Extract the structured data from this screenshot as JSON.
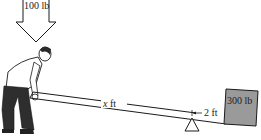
{
  "diagram": {
    "type": "lever",
    "applied_force": {
      "label": "100 lb",
      "icon": "down-arrow-icon"
    },
    "load": {
      "label": "300 lb"
    },
    "distances": {
      "effort_arm": {
        "variable": "x",
        "unit": "ft"
      },
      "load_arm": {
        "label": "2 ft"
      }
    },
    "fulcrum": {
      "icon": "triangle-fulcrum-icon"
    },
    "person": {
      "description": "man bending to push lever down"
    },
    "colors": {
      "load_fill": "#9a9a9a",
      "line": "#1a1a1a",
      "background": "#ffffff",
      "trousers": "#2e2e2e"
    }
  }
}
